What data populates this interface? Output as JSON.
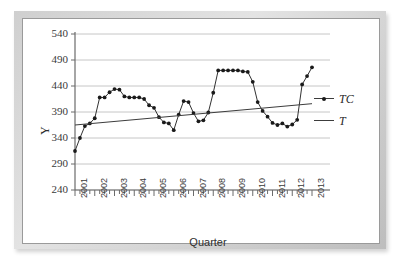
{
  "chart_data": {
    "type": "line",
    "title": "",
    "xlabel": "Quarter",
    "ylabel": "Y",
    "ylim": [
      240,
      540
    ],
    "yticks": [
      240,
      290,
      340,
      390,
      440,
      490,
      540
    ],
    "xticks": [
      "2001",
      "2002",
      "2003",
      "2004",
      "2005",
      "2006",
      "2007",
      "2008",
      "2009",
      "2010",
      "2011",
      "2012",
      "2013"
    ],
    "grid": true,
    "legend_position": "right",
    "x_minor_ticks_per_year": 4,
    "series": [
      {
        "name": "TC",
        "style": "line-with-markers",
        "color": "#1a1a1a",
        "x": [
          "2001Q1",
          "2001Q2",
          "2001Q3",
          "2001Q4",
          "2002Q1",
          "2002Q2",
          "2002Q3",
          "2002Q4",
          "2003Q1",
          "2003Q2",
          "2003Q3",
          "2003Q4",
          "2004Q1",
          "2004Q2",
          "2004Q3",
          "2004Q4",
          "2005Q1",
          "2005Q2",
          "2005Q3",
          "2005Q4",
          "2006Q1",
          "2006Q2",
          "2006Q3",
          "2006Q4",
          "2007Q1",
          "2007Q2",
          "2007Q3",
          "2007Q4",
          "2008Q1",
          "2008Q2",
          "2008Q3",
          "2008Q4",
          "2009Q1",
          "2009Q2",
          "2009Q3",
          "2009Q4",
          "2010Q1",
          "2010Q2",
          "2010Q3",
          "2010Q4",
          "2011Q1",
          "2011Q2",
          "2011Q3",
          "2011Q4",
          "2012Q1",
          "2012Q2",
          "2012Q3",
          "2012Q4",
          "2013Q1"
        ],
        "values": [
          315,
          340,
          363,
          368,
          378,
          418,
          418,
          428,
          434,
          433,
          420,
          418,
          418,
          418,
          415,
          403,
          398,
          380,
          370,
          368,
          355,
          385,
          411,
          409,
          388,
          372,
          374,
          389,
          427,
          470,
          470,
          470,
          470,
          470,
          468,
          467,
          448,
          409,
          392,
          381,
          369,
          365,
          368,
          362,
          366,
          375,
          443,
          459,
          476
        ]
      },
      {
        "name": "T",
        "style": "trend-line",
        "color": "#3c3c3c",
        "description": "linear trend",
        "endpoints": [
          {
            "x": "2001Q1",
            "y": 365
          },
          {
            "x": "2013Q1",
            "y": 406
          }
        ]
      }
    ],
    "legend": [
      {
        "label": "TC",
        "marker": "dot-with-line"
      },
      {
        "label": "T",
        "marker": "line"
      }
    ]
  }
}
